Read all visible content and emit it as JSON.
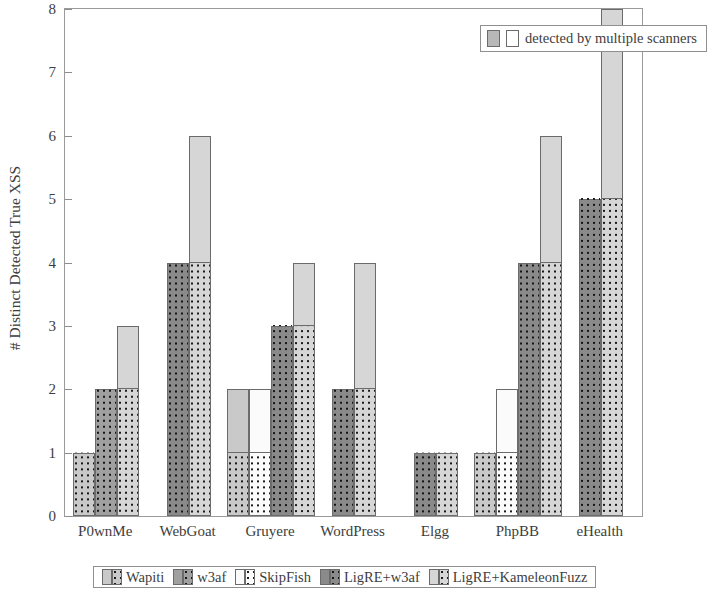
{
  "chart_data": {
    "type": "bar",
    "title": "",
    "xlabel": "",
    "ylabel": "# Distinct Detected True XSS",
    "ylim": [
      0,
      8
    ],
    "yticks": [
      0,
      1,
      2,
      3,
      4,
      5,
      6,
      7,
      8
    ],
    "grid": false,
    "categories": [
      "P0wnMe",
      "WebGoat",
      "Gruyere",
      "WordPress",
      "Elgg",
      "PhpBB",
      "eHealth"
    ],
    "series": [
      {
        "name": "Wapiti",
        "color": "#c9c9c9",
        "values": [
          1,
          0,
          2,
          0,
          0,
          1,
          0
        ],
        "multi_values": [
          1,
          0,
          1,
          0,
          0,
          1,
          0
        ]
      },
      {
        "name": "w3af",
        "color": "#a0a0a0",
        "values": [
          2,
          0,
          0,
          0,
          0,
          0,
          0
        ],
        "multi_values": [
          2,
          0,
          0,
          0,
          0,
          0,
          0
        ]
      },
      {
        "name": "SkipFish",
        "color": "#fbfbfb",
        "values": [
          0,
          0,
          2,
          0,
          0,
          2,
          0
        ],
        "multi_values": [
          0,
          0,
          1,
          0,
          0,
          1,
          0
        ]
      },
      {
        "name": "LigRE+w3af",
        "color": "#8a8a8a",
        "values": [
          0,
          4,
          3,
          2,
          1,
          4,
          5
        ],
        "multi_values": [
          0,
          4,
          3,
          2,
          1,
          4,
          5
        ]
      },
      {
        "name": "LigRE+KameleonFuzz",
        "color": "#d6d6d6",
        "values": [
          3,
          6,
          4,
          4,
          1,
          6,
          8
        ],
        "multi_values": [
          2,
          4,
          3,
          2,
          1,
          4,
          5
        ]
      }
    ],
    "legend_top": "detected by multiple scanners",
    "legend_position": "bottom"
  },
  "legend_top": {
    "label": "detected by multiple scanners"
  },
  "axis": {
    "y_title": "# Distinct Detected True XSS"
  }
}
